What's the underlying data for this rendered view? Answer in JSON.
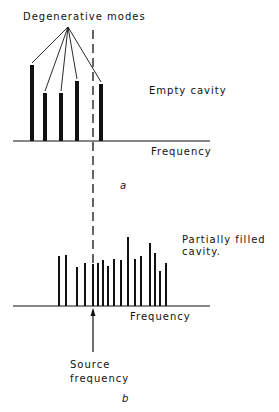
{
  "labels": {
    "degenerative_modes": "Degenerative modes",
    "empty_cavity": "Empty cavity",
    "frequency_a": "Frequency",
    "panel_a": "a",
    "partially_filled_1": "Partially  filled",
    "partially_filled_2": "cavity.",
    "frequency_b": "Frequency",
    "source_1": "Source",
    "source_2": "frequency",
    "panel_b": "b"
  },
  "colors": {
    "ink": "#111111",
    "background": "#ffffff"
  },
  "diagram": {
    "panel_a": {
      "baseline_y": 141,
      "axis_x": [
        13,
        210
      ],
      "bars": [
        {
          "x": 32,
          "top": 65,
          "width": 4
        },
        {
          "x": 45,
          "top": 93,
          "width": 4
        },
        {
          "x": 61,
          "top": 93,
          "width": 4
        },
        {
          "x": 77,
          "top": 81,
          "width": 4
        },
        {
          "x": 101,
          "top": 84,
          "width": 4
        }
      ],
      "pointer_origin": [
        68,
        27
      ]
    },
    "panel_b": {
      "baseline_y": 306,
      "axis_x": [
        13,
        210
      ],
      "bars": [
        {
          "x": 59,
          "top": 256
        },
        {
          "x": 66,
          "top": 255
        },
        {
          "x": 77,
          "top": 267
        },
        {
          "x": 85,
          "top": 263
        },
        {
          "x": 93,
          "top": 264
        },
        {
          "x": 98,
          "top": 263
        },
        {
          "x": 103,
          "top": 260
        },
        {
          "x": 108,
          "top": 266
        },
        {
          "x": 114,
          "top": 259
        },
        {
          "x": 121,
          "top": 260
        },
        {
          "x": 128,
          "top": 237
        },
        {
          "x": 135,
          "top": 259
        },
        {
          "x": 141,
          "top": 256
        },
        {
          "x": 150,
          "top": 243
        },
        {
          "x": 155,
          "top": 253
        },
        {
          "x": 160,
          "top": 271
        },
        {
          "x": 166,
          "top": 263
        }
      ],
      "arrow": {
        "x": 93,
        "from_y": 352,
        "to_y": 308
      }
    },
    "dashed_line": {
      "x": 93,
      "from_y": 30,
      "to_y": 312
    }
  }
}
